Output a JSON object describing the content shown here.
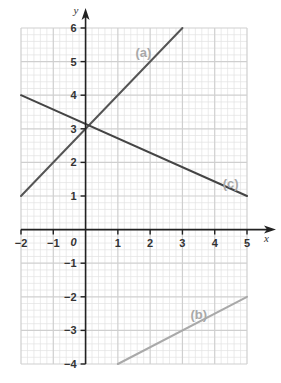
{
  "chart_data": {
    "type": "line",
    "title": "",
    "xlabel": "x",
    "ylabel": "y",
    "xlim": [
      -2,
      5
    ],
    "ylim": [
      -4,
      6
    ],
    "grid": true,
    "grid_minor_step": 0.2,
    "origin_label": "0",
    "x_ticks": [
      -2,
      -1,
      1,
      2,
      3,
      4,
      5
    ],
    "x_tick_labels": [
      "−2",
      "−1",
      "1",
      "2",
      "3",
      "4",
      "5"
    ],
    "y_ticks": [
      6,
      5,
      4,
      3,
      2,
      1,
      -1,
      -2,
      -3,
      -4
    ],
    "y_tick_labels": [
      "6",
      "5",
      "4",
      "3",
      "2",
      "1",
      "−1",
      "−2",
      "−3",
      "−4"
    ],
    "series": [
      {
        "name": "(a)",
        "equation": "y = x + 3",
        "x": [
          -2,
          3
        ],
        "y": [
          1,
          6
        ],
        "color": "#555555",
        "label_pos": [
          1.3,
          5.3
        ]
      },
      {
        "name": "(b)",
        "equation": "y = 0.5x - 4.5",
        "x": [
          1,
          5
        ],
        "y": [
          -4,
          -2
        ],
        "color": "#a9a9a9",
        "label_pos": [
          3.0,
          -2.5
        ]
      },
      {
        "name": "(c)",
        "equation": "y = -3/7 x + 22/7",
        "x": [
          -2,
          5
        ],
        "y": [
          4,
          1
        ],
        "color": "#444444",
        "label_pos": [
          4.0,
          1.4
        ]
      }
    ],
    "legend": null
  },
  "colors": {
    "grid_minor": "#e2e2e2",
    "grid_major": "#cfcfcf",
    "axis": "#222222"
  }
}
